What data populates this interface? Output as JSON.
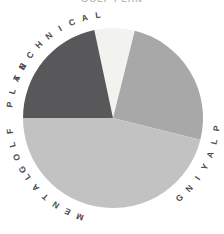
{
  "title": {
    "text": "GOLF PLAN"
  },
  "canvas": {
    "width": 224,
    "height": 234,
    "background": "#ffffff"
  },
  "chart_data": {
    "type": "pie",
    "title": "GOLF PLAN",
    "xlabel": "",
    "ylabel": "",
    "legend_position": "none",
    "grid": false,
    "center_x": 113,
    "center_y": 118,
    "radius": 90,
    "start_angle_deg": -12,
    "direction": "clockwise",
    "categories": [
      "GOLF PLAN",
      "TECHNICAL",
      "PLAYING",
      "MENTAL"
    ],
    "values": [
      7,
      25,
      46,
      22
    ],
    "unit": "%",
    "colors": [
      "#f2f2ef",
      "#a8a8a8",
      "#c2c2c2",
      "#58585a"
    ],
    "slices": [
      {
        "label": "GOLF PLAN",
        "value": 7,
        "color": "#f2f2ef",
        "start_deg": -12,
        "end_deg": 14,
        "label_position": "top",
        "label_color": "#4a4a4c"
      },
      {
        "label": "TECHNICAL",
        "value": 25,
        "color": "#a8a8a8",
        "start_deg": 14,
        "end_deg": 104,
        "label_position": "upper-right",
        "label_color": "#4a4a4c"
      },
      {
        "label": "PLAYING",
        "value": 46,
        "color": "#c2c2c2",
        "start_deg": 104,
        "end_deg": 270,
        "label_position": "bottom",
        "label_color": "#4a4a4c"
      },
      {
        "label": "MENTAL",
        "value": 22,
        "color": "#58585a",
        "start_deg": 270,
        "end_deg": 348,
        "label_position": "upper-left",
        "label_color": "#4a4a4c"
      }
    ]
  },
  "labels": {
    "golf_plan": {
      "text": "GOLF PLAN",
      "center_angle_deg": -90,
      "radius": 104,
      "char_spacing_deg": 7.4,
      "flip": false
    },
    "technical": {
      "text": "TECHNICAL",
      "center_angle_deg": -38,
      "radius": 104,
      "char_spacing_deg": 7.4,
      "flip": false
    },
    "playing": {
      "text": "PLAYING",
      "center_angle_deg": 118,
      "radius": 104,
      "char_spacing_deg": 7.4,
      "flip": true
    },
    "mental": {
      "text": "MENTAL",
      "center_angle_deg": -143,
      "radius": 104,
      "char_spacing_deg": 7.4,
      "flip": false
    }
  }
}
